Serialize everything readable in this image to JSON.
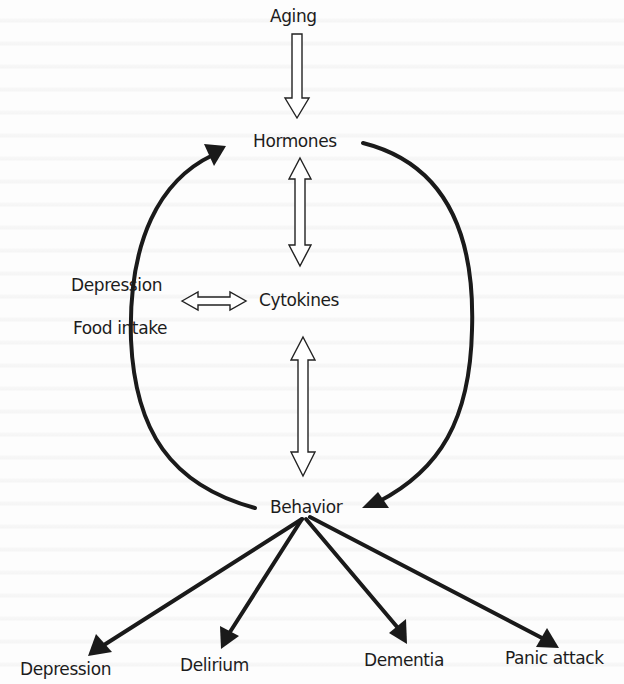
{
  "diagram": {
    "nodes": {
      "aging": "Aging",
      "hormones": "Hormones",
      "cytokines": "Cytokines",
      "behavior": "Behavior",
      "depression_input": "Depression",
      "food_intake": "Food intake"
    },
    "outcomes": [
      "Depression",
      "Delirium",
      "Dementia",
      "Panic attack"
    ],
    "edges": [
      {
        "from": "Aging",
        "to": "Hormones",
        "style": "hollow",
        "direction": "one-way"
      },
      {
        "from": "Hormones",
        "to": "Cytokines",
        "style": "hollow",
        "direction": "two-way"
      },
      {
        "from": "Cytokines",
        "to": "Behavior",
        "style": "hollow",
        "direction": "two-way"
      },
      {
        "from": "Depression / Food intake",
        "to": "Cytokines",
        "style": "hollow",
        "direction": "two-way"
      },
      {
        "from": "Hormones",
        "to": "Behavior",
        "style": "solid-curve",
        "direction": "one-way"
      },
      {
        "from": "Behavior",
        "to": "Hormones",
        "style": "solid-curve",
        "direction": "one-way"
      },
      {
        "from": "Behavior",
        "to": "Depression",
        "style": "solid",
        "direction": "one-way"
      },
      {
        "from": "Behavior",
        "to": "Delirium",
        "style": "solid",
        "direction": "one-way"
      },
      {
        "from": "Behavior",
        "to": "Dementia",
        "style": "solid",
        "direction": "one-way"
      },
      {
        "from": "Behavior",
        "to": "Panic attack",
        "style": "solid",
        "direction": "one-way"
      }
    ],
    "colors": {
      "ink": "#1a1a1a",
      "paper": "#fdfdfd"
    }
  }
}
